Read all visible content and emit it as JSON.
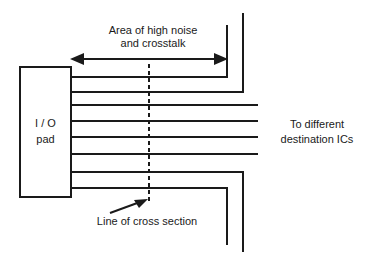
{
  "diagram": {
    "labels": {
      "noise_area_line1": "Area of high noise",
      "noise_area_line2": "and crosstalk",
      "pad_line1": "I / O",
      "pad_line2": "pad",
      "dest_line1": "To different",
      "dest_line2": "destination ICs",
      "cross_section": "Line of cross section"
    },
    "colors": {
      "stroke": "#1a1a1a",
      "background": "#ffffff"
    }
  }
}
